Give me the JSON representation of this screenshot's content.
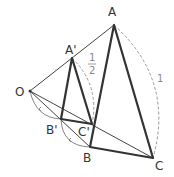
{
  "points": {
    "O": {
      "label": "O",
      "x": 30,
      "y": 91
    },
    "A": {
      "label": "A",
      "x": 114,
      "y": 25
    },
    "B": {
      "label": "B",
      "x": 90,
      "y": 147
    },
    "C": {
      "label": "C",
      "x": 153,
      "y": 158
    },
    "A1": {
      "label": "A'",
      "x": 72,
      "y": 58
    },
    "B1": {
      "label": "B'",
      "x": 61,
      "y": 119
    },
    "C1": {
      "label": "C'",
      "x": 92,
      "y": 124
    }
  },
  "ratios": {
    "small": {
      "num": "1",
      "den": "2"
    },
    "large": "1"
  },
  "colors": {
    "thick": "#333333",
    "thin": "#444444",
    "dashed": "#999999"
  }
}
